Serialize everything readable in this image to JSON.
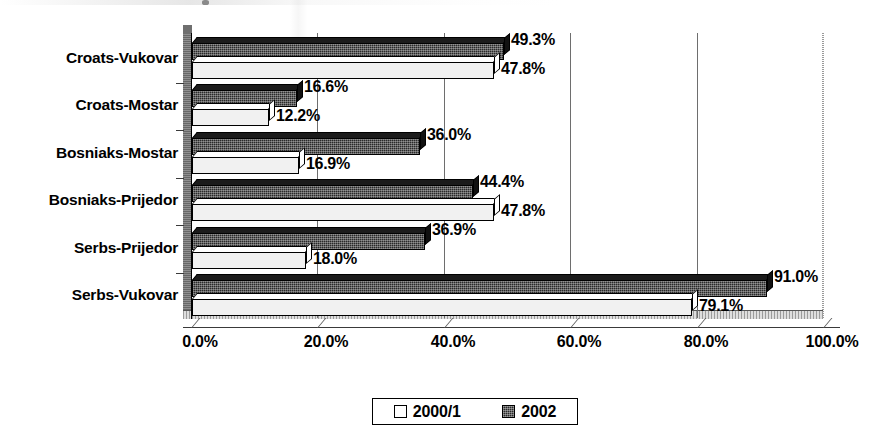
{
  "chart_data": {
    "type": "bar",
    "orientation": "horizontal",
    "title": "",
    "subtitle": "",
    "xlabel": "",
    "ylabel": "",
    "xlim": [
      0,
      100
    ],
    "xticks": [
      "0.0%",
      "20.0%",
      "40.0%",
      "60.0%",
      "80.0%",
      "100.0%"
    ],
    "xtick_values": [
      0,
      20,
      40,
      60,
      80,
      100
    ],
    "grid": true,
    "grid_axis": "x",
    "legend_position": "bottom",
    "categories": [
      "Croats-Vukovar",
      "Croats-Mostar",
      "Bosniaks-Mostar",
      "Bosniaks-Prijedor",
      "Serbs-Prijedor",
      "Serbs-Vukovar"
    ],
    "series": [
      {
        "name": "2000/1",
        "style": "light",
        "values": [
          47.8,
          12.2,
          16.9,
          47.8,
          18.0,
          79.1
        ],
        "labels": [
          "47.8%",
          "12.2%",
          "16.9%",
          "47.8%",
          "18.0%",
          "79.1%"
        ]
      },
      {
        "name": "2002",
        "style": "dark",
        "values": [
          49.3,
          16.6,
          36.0,
          44.4,
          36.9,
          91.0
        ],
        "labels": [
          "49.3%",
          "16.6%",
          "36.0%",
          "44.4%",
          "36.9%",
          "91.0%"
        ]
      }
    ]
  },
  "legend": {
    "items": [
      {
        "label": "2000/1",
        "swatch": "light-swatch-icon"
      },
      {
        "label": "2002",
        "swatch": "dark-swatch-icon"
      }
    ]
  },
  "colors": {
    "series_2002": "#2a2a2a",
    "series_2000_1": "#f1f1f1",
    "axis": "#000000",
    "gridline": "#6e6e6e",
    "background": "#ffffff"
  }
}
